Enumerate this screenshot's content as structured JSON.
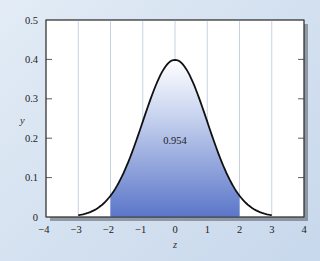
{
  "chart_data": {
    "type": "area",
    "title": "",
    "xlabel": "z",
    "ylabel": "y",
    "xlim": [
      -4,
      4
    ],
    "ylim": [
      0,
      0.5
    ],
    "x_ticks": [
      "−4",
      "−3",
      "−2",
      "−1",
      "0",
      "1",
      "2",
      "3",
      "4"
    ],
    "y_ticks": [
      "0",
      "0.1",
      "0.2",
      "0.3",
      "0.4",
      "0.5"
    ],
    "grid": "vertical lines at integer z",
    "curve": "standard normal density y = (1/sqrt(2π)) e^(−z²/2), drawn from z=−3 to z=3",
    "shaded_region": {
      "from": -2,
      "to": 2,
      "area": 0.954
    },
    "annotation": {
      "text": "0.954",
      "x": 0,
      "y": 0.19
    },
    "series": [
      {
        "name": "standard normal pdf",
        "x": [
          -3,
          -2.5,
          -2,
          -1.5,
          -1,
          -0.5,
          0,
          0.5,
          1,
          1.5,
          2,
          2.5,
          3
        ],
        "values": [
          0.004,
          0.018,
          0.054,
          0.13,
          0.242,
          0.352,
          0.399,
          0.352,
          0.242,
          0.13,
          0.054,
          0.018,
          0.004
        ]
      }
    ],
    "colors": {
      "shade_bottom": "#5b76c9",
      "shade_top": "#ffffff",
      "curve": "#111111",
      "grid": "#b8c6dc"
    }
  }
}
